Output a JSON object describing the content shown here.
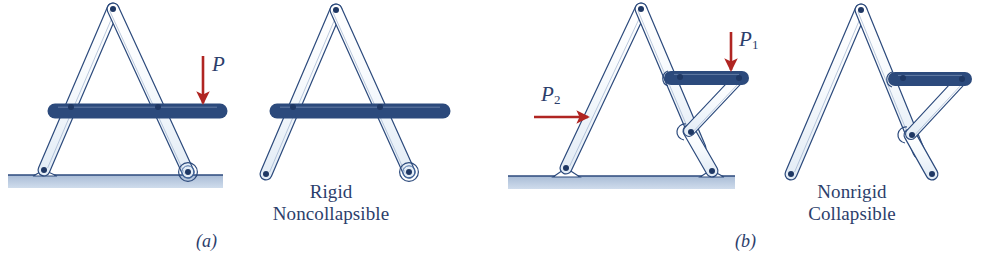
{
  "figure": {
    "type": "engineering-diagram",
    "topic": "Rigid vs nonrigid pin-jointed frame structures",
    "background_color": "#ffffff",
    "link_fill_color": "#f4f8fc",
    "link_stroke_color": "#2c4a7c",
    "joint_color": "#1f3864",
    "ground_fill_color": "#b9c8de",
    "ground_line_color": "#2c4a7c",
    "arrow_color": "#b02522",
    "text_color": "#2c3e6b"
  },
  "panels": [
    {
      "id": "a",
      "caption": "(a)",
      "description_lines": [
        "Rigid",
        "Noncollapsible"
      ],
      "loads": [
        {
          "name": "P",
          "symbol": "P",
          "subscript": "",
          "direction": "down"
        }
      ]
    },
    {
      "id": "b",
      "caption": "(b)",
      "description_lines": [
        "Nonrigid",
        "Collapsible"
      ],
      "loads": [
        {
          "name": "P1",
          "symbol": "P",
          "subscript": "1",
          "direction": "down"
        },
        {
          "name": "P2",
          "symbol": "P",
          "subscript": "2",
          "direction": "right"
        }
      ]
    }
  ],
  "labels": {
    "panel_a_load": "P",
    "panel_a_caption": "(a)",
    "panel_a_desc_line1": "Rigid",
    "panel_a_desc_line2": "Noncollapsible",
    "panel_b_load1_symbol": "P",
    "panel_b_load1_sub": "1",
    "panel_b_load2_symbol": "P",
    "panel_b_load2_sub": "2",
    "panel_b_caption": "(b)",
    "panel_b_desc_line1": "Nonrigid",
    "panel_b_desc_line2": "Collapsible"
  }
}
